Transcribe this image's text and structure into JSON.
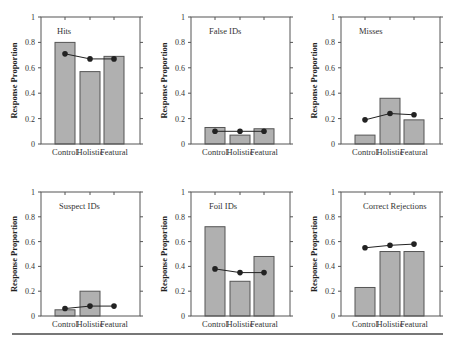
{
  "chart_data": [
    {
      "type": "bar",
      "title": "Hits",
      "categories": [
        "Control",
        "Holistic",
        "Featural"
      ],
      "series": [
        {
          "name": "Observed",
          "kind": "bar",
          "values": [
            0.8,
            0.57,
            0.69
          ]
        },
        {
          "name": "Predicted",
          "kind": "line",
          "values": [
            0.71,
            0.67,
            0.67
          ]
        }
      ],
      "xlabel": "",
      "ylabel": "Response Proportion",
      "ylim": [
        0,
        1
      ],
      "yticks": [
        "0",
        "0.2",
        "0.4",
        "0.6",
        "0.8",
        "1"
      ]
    },
    {
      "type": "bar",
      "title": "False IDs",
      "categories": [
        "Control",
        "Holistic",
        "Featural"
      ],
      "series": [
        {
          "name": "Observed",
          "kind": "bar",
          "values": [
            0.13,
            0.07,
            0.12
          ]
        },
        {
          "name": "Predicted",
          "kind": "line",
          "values": [
            0.1,
            0.1,
            0.1
          ]
        }
      ],
      "xlabel": "",
      "ylabel": "Response Proportion",
      "ylim": [
        0,
        1
      ],
      "yticks": [
        "0",
        "0.2",
        "0.4",
        "0.6",
        "0.8",
        "1"
      ]
    },
    {
      "type": "bar",
      "title": "Misses",
      "categories": [
        "Control",
        "Holistic",
        "Featural"
      ],
      "series": [
        {
          "name": "Observed",
          "kind": "bar",
          "values": [
            0.07,
            0.36,
            0.19
          ]
        },
        {
          "name": "Predicted",
          "kind": "line",
          "values": [
            0.19,
            0.24,
            0.23
          ]
        }
      ],
      "xlabel": "",
      "ylabel": "Response Proportion",
      "ylim": [
        0,
        1
      ],
      "yticks": [
        "0",
        "0.2",
        "0.4",
        "0.6",
        "0.8",
        "1"
      ]
    },
    {
      "type": "bar",
      "title": "Suspect IDs",
      "categories": [
        "Control",
        "Holistic",
        "Featural"
      ],
      "series": [
        {
          "name": "Observed",
          "kind": "bar",
          "values": [
            0.05,
            0.2,
            0.0
          ]
        },
        {
          "name": "Predicted",
          "kind": "line",
          "values": [
            0.06,
            0.08,
            0.08
          ]
        }
      ],
      "xlabel": "",
      "ylabel": "Response Proportion",
      "ylim": [
        0,
        1
      ],
      "yticks": [
        "0",
        "0.2",
        "0.4",
        "0.6",
        "0.8",
        "1"
      ]
    },
    {
      "type": "bar",
      "title": "Foil IDs",
      "categories": [
        "Control",
        "Holistic",
        "Featural"
      ],
      "series": [
        {
          "name": "Observed",
          "kind": "bar",
          "values": [
            0.72,
            0.28,
            0.48
          ]
        },
        {
          "name": "Predicted",
          "kind": "line",
          "values": [
            0.38,
            0.35,
            0.35
          ]
        }
      ],
      "xlabel": "",
      "ylabel": "Response Proportion",
      "ylim": [
        0,
        1
      ],
      "yticks": [
        "0",
        "0.2",
        "0.4",
        "0.6",
        "0.8",
        "1"
      ]
    },
    {
      "type": "bar",
      "title": "Correct Rejections",
      "categories": [
        "Control",
        "Holistic",
        "Featural"
      ],
      "series": [
        {
          "name": "Observed",
          "kind": "bar",
          "values": [
            0.23,
            0.52,
            0.52
          ]
        },
        {
          "name": "Predicted",
          "kind": "line",
          "values": [
            0.55,
            0.57,
            0.58
          ]
        }
      ],
      "xlabel": "",
      "ylabel": "Response Proportion",
      "ylim": [
        0,
        1
      ],
      "yticks": [
        "0",
        "0.2",
        "0.4",
        "0.6",
        "0.8",
        "1"
      ]
    }
  ],
  "colors": {
    "bar_fill": "#b0b0b0",
    "bar_stroke": "#555555",
    "line": "#222222",
    "axis": "#555555",
    "rule": "#777777"
  }
}
